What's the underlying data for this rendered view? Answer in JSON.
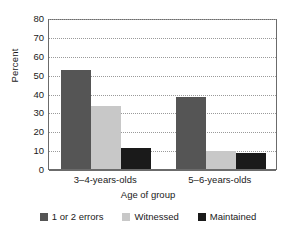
{
  "chart_data": {
    "type": "bar",
    "title": "",
    "subtitle": "",
    "xlabel": "Age of group",
    "ylabel": "Percent",
    "categories": [
      "3–4-years-olds",
      "5–6-years-olds"
    ],
    "series": [
      {
        "name": "1 or 2 errors",
        "color": "#555555",
        "values": [
          52.5,
          38.0
        ]
      },
      {
        "name": "Witnessed",
        "color": "#c8c8c8",
        "values": [
          33.5,
          9.5
        ]
      },
      {
        "name": "Maintained",
        "color": "#1a1a1a",
        "values": [
          11.0,
          8.5
        ]
      }
    ],
    "ylim": [
      0,
      80
    ],
    "yticks": [
      0,
      10,
      20,
      30,
      40,
      50,
      60,
      70,
      80
    ],
    "ytick_labels": [
      "0",
      "10",
      "20",
      "30",
      "40",
      "50",
      "60",
      "70",
      "80"
    ],
    "grid": true,
    "grid_axis": "y",
    "grid_style": "dotted",
    "legend_position": "bottom",
    "bar_gap_within_group": 0,
    "plot_background": "#ffffff",
    "frame_color": "#6b6b6b"
  }
}
